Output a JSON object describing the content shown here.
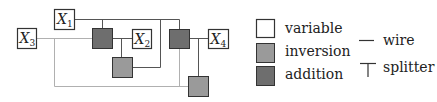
{
  "colors": {
    "variable_fill": "#ffffff",
    "inversion_fill": "#9a9a9a",
    "addition_fill": "#6e6e6e",
    "box_stroke": "#333333",
    "wire_dark": "#555555",
    "wire_light": "#b0b0b0"
  },
  "diagram": {
    "variables": [
      {
        "id": "x1",
        "name": "X",
        "sub": "1"
      },
      {
        "id": "x2",
        "name": "X",
        "sub": "2"
      },
      {
        "id": "x3",
        "name": "X",
        "sub": "3"
      },
      {
        "id": "x4",
        "name": "X",
        "sub": "4"
      }
    ],
    "inversions": 2,
    "additions": 2
  },
  "legend": {
    "items": [
      {
        "key": "variable",
        "label": "variable"
      },
      {
        "key": "inversion",
        "label": "inversion"
      },
      {
        "key": "addition",
        "label": "addition"
      },
      {
        "key": "wire",
        "label": "wire"
      },
      {
        "key": "splitter",
        "label": "splitter"
      }
    ]
  }
}
